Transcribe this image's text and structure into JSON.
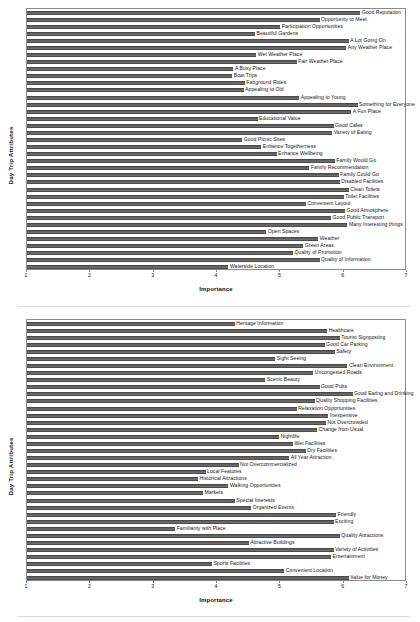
{
  "figure": {
    "width": 420,
    "height": 622,
    "bar_color": "#6d6d6d",
    "frame_color": "#8a8a8a"
  },
  "chart_data": [
    {
      "type": "bar",
      "orientation": "horizontal",
      "title": "",
      "xlabel": "Importance",
      "ylabel": "Day Trip Attributes",
      "xlim": [
        1,
        7
      ],
      "xticks": [
        1,
        2,
        3,
        4,
        5,
        6,
        7
      ],
      "xtick_labels": [
        "1",
        "2",
        "3",
        "4",
        "5",
        "6",
        "7"
      ],
      "grid": false,
      "categories": [
        "Good Reputation",
        "Opportunity to Meet",
        "Participation Opportunities",
        "Beautiful Gardens",
        "A Lot Going On",
        "Any Weather Place",
        "Wet Weather Place",
        "Fair Weather Place",
        "A Busy Place",
        "Boat Trips",
        "Fairground Rides",
        "Appealing to Old",
        "Appealing to Young",
        "Something for Everyone",
        "A Fun Place",
        "Educational Value",
        "Good Cafes",
        "Variety of Eating",
        "Good Picnic Sites",
        "Enhance Togetherness",
        "Enhance Wellbeing",
        "Family Would Go",
        "Family Recommendation",
        "Family Could Go",
        "Disabled Facilities",
        "Clean Toilets",
        "Toilet Facilities",
        "Convenient Layout",
        "Good Atmosphere",
        "Good Public Transport",
        "Many Interesting things",
        "Open Spaces",
        "Weather",
        "Green Areas",
        "Quality of Promotion",
        "Quality of Information",
        "Waterside Location"
      ],
      "values": [
        6.26,
        5.62,
        5.0,
        4.6,
        6.08,
        6.04,
        4.62,
        5.26,
        4.26,
        4.24,
        4.44,
        4.42,
        5.3,
        6.22,
        6.12,
        4.64,
        5.84,
        5.82,
        4.4,
        4.7,
        4.94,
        5.86,
        5.46,
        5.92,
        5.94,
        6.08,
        6.0,
        5.4,
        6.02,
        5.8,
        6.06,
        4.78,
        5.6,
        5.36,
        5.2,
        5.62,
        4.18
      ]
    },
    {
      "type": "bar",
      "orientation": "horizontal",
      "title": "",
      "xlabel": "Importance",
      "ylabel": "Day Trip Attributes",
      "xlim": [
        1,
        7
      ],
      "xticks": [
        1,
        2,
        3,
        4,
        5,
        6,
        7
      ],
      "xtick_labels": [
        "1",
        "2",
        "3",
        "4",
        "5",
        "6",
        "7"
      ],
      "grid": false,
      "categories": [
        "Heritage Information",
        "Healthcare",
        "Tourist Signposting",
        "Good Car Parking",
        "Safety",
        "Sight Seeing",
        "Clean Environment",
        "Uncongested Roads",
        "Scenic Beauty",
        "Good Pubs",
        "Good Eating and Drinking",
        "Quality Shopping Facilities",
        "Relaxation Opportunities",
        "Inexpensive",
        "Not Overcrowded",
        "Change from Usual",
        "Nightlife",
        "Wet Facilities",
        "Dry Facilities",
        "All Year Attraction",
        "Not Overcommercialized",
        "Local Features",
        "Historical Attractions",
        "Walking Opportunities",
        "Markets",
        "Special Interests",
        "Organized Events",
        "Friendly",
        "Exciting",
        "Familiarity with Place",
        "Quality Attractions",
        "Attractive Buildings",
        "Variety of Activities",
        "Entertainment",
        "Sports Facilities",
        "Convenient Location",
        "Value for Money"
      ],
      "values": [
        4.28,
        5.74,
        5.94,
        5.7,
        5.86,
        4.92,
        6.06,
        5.52,
        4.76,
        5.62,
        6.14,
        5.54,
        5.26,
        5.76,
        5.72,
        5.58,
        4.98,
        5.2,
        5.4,
        5.14,
        4.34,
        3.82,
        3.7,
        4.18,
        3.78,
        4.28,
        4.54,
        5.88,
        5.84,
        3.34,
        5.94,
        4.5,
        5.84,
        5.8,
        3.92,
        5.06,
        6.08
      ]
    }
  ]
}
